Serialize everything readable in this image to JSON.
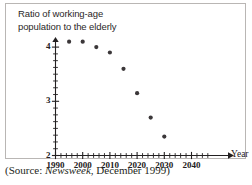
{
  "figure": {
    "axis_title_line1": "Ratio of working-age",
    "axis_title_line2": "population to the elderly",
    "x_axis_name": "Year",
    "source_prefix": "(Source: ",
    "source_publication": "Newsweek",
    "source_suffix": ", December 1999)",
    "frame_color": "#b9b6b4",
    "axis_color": "#232021",
    "dot_color": "#3b3739"
  },
  "chart_data": {
    "type": "scatter",
    "title": "Ratio of working-age population to the elderly",
    "xlabel": "Year",
    "ylabel": "Ratio of working-age population to the elderly",
    "xlim": [
      1990,
      2046
    ],
    "ylim": [
      2,
      4.2
    ],
    "grid": false,
    "legend": null,
    "x_ticks_major": [
      1990,
      2000,
      2010,
      2020,
      2030,
      2040
    ],
    "x_tick_labels": [
      "1990",
      "2000",
      "2010",
      "2020",
      "2030",
      "2040"
    ],
    "x_tick_minor_step": 2,
    "y_ticks_major": [
      2,
      3,
      4
    ],
    "y_tick_labels": [
      "2",
      "3",
      "4"
    ],
    "y_tick_minor_step": 0.125,
    "x": [
      1995,
      2000,
      2005,
      2010,
      2015,
      2020,
      2025,
      2030
    ],
    "values": [
      4.1,
      4.1,
      4.0,
      3.9,
      3.6,
      3.15,
      2.7,
      2.35
    ],
    "points": [
      {
        "x": 1995,
        "y": 4.1
      },
      {
        "x": 2000,
        "y": 4.1
      },
      {
        "x": 2005,
        "y": 4.0
      },
      {
        "x": 2010,
        "y": 3.9
      },
      {
        "x": 2015,
        "y": 3.6
      },
      {
        "x": 2020,
        "y": 3.15
      },
      {
        "x": 2025,
        "y": 2.7
      },
      {
        "x": 2030,
        "y": 2.35
      }
    ],
    "annotation_source": "(Source: Newsweek, December 1999)"
  }
}
